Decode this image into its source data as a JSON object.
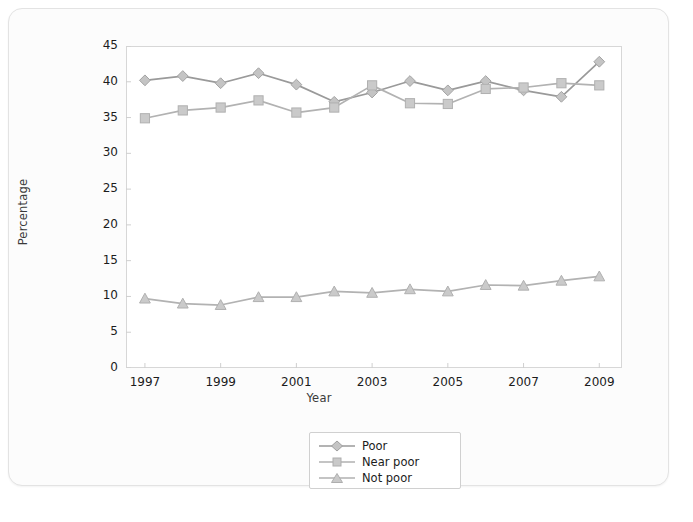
{
  "chart_data": {
    "type": "line",
    "title": "",
    "xlabel": "Year",
    "ylabel": "Percentage",
    "x": [
      1997,
      1998,
      1999,
      2000,
      2001,
      2002,
      2003,
      2004,
      2005,
      2006,
      2007,
      2008,
      2009
    ],
    "xtick_labels": [
      "1997",
      "1999",
      "2001",
      "2003",
      "2005",
      "2007",
      "2009"
    ],
    "xtick_values": [
      1997,
      1999,
      2001,
      2003,
      2005,
      2007,
      2009
    ],
    "ytick_labels": [
      "0",
      "5",
      "10",
      "15",
      "20",
      "25",
      "30",
      "35",
      "40",
      "45"
    ],
    "ylim": [
      0,
      45
    ],
    "xlim": [
      1996.5,
      2009.6
    ],
    "grid": false,
    "legend_position": "bottom-center",
    "series": [
      {
        "name": "Poor",
        "marker": "diamond",
        "color": "#a8a8a8",
        "values": [
          40.2,
          40.8,
          39.8,
          41.2,
          39.6,
          37.2,
          38.5,
          40.1,
          38.8,
          40.1,
          38.8,
          37.9,
          42.8
        ]
      },
      {
        "name": "Near poor",
        "marker": "square",
        "color": "#bdbdbd",
        "values": [
          34.9,
          36.0,
          36.4,
          37.4,
          35.7,
          36.4,
          39.5,
          37.0,
          36.9,
          39.0,
          39.2,
          39.8,
          39.5
        ]
      },
      {
        "name": "Not poor",
        "marker": "triangle",
        "color": "#bdbdbd",
        "values": [
          9.7,
          9.0,
          8.8,
          9.9,
          9.9,
          10.7,
          10.5,
          11.0,
          10.7,
          11.6,
          11.5,
          12.2,
          12.8
        ]
      }
    ]
  },
  "legend": {
    "items": [
      {
        "label": "Poor"
      },
      {
        "label": "Near poor"
      },
      {
        "label": "Not poor"
      }
    ]
  },
  "colors": {
    "line": "#9a9a9a",
    "marker_fill": "#c4c4c4",
    "marker_stroke": "#a0a0a0",
    "frame": "#d7d7d7",
    "text": "#1c1c1c",
    "card_bg": "#fcfcfc",
    "tab": "#4a4a4a"
  },
  "bottom": {
    "tab_label": ""
  }
}
